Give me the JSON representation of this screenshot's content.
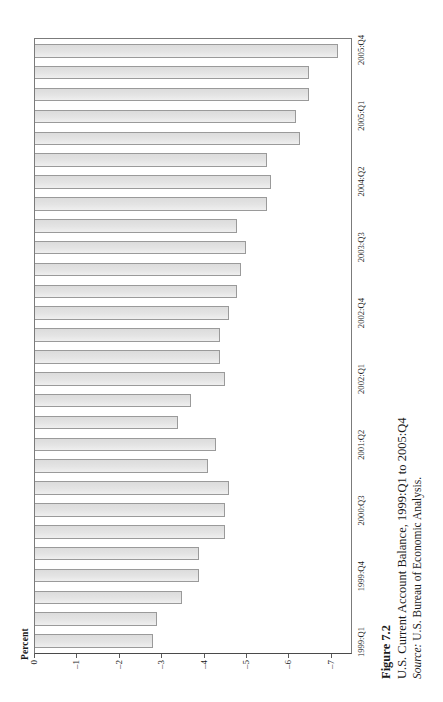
{
  "figure": {
    "number_label": "Figure 7.2",
    "title": "U.S. Current Account Balance, 1999:Q1 to 2005:Q4",
    "source_prefix": "Source:",
    "source_text": " U.S. Bureau of Economic Analysis."
  },
  "axis": {
    "value_axis_title": "Percent",
    "value_ticks": [
      "0",
      "–1",
      "–2",
      "–3",
      "–4",
      "–5",
      "–6",
      "–7"
    ],
    "category_ticks": [
      {
        "label": "1999:Q1",
        "index": 0
      },
      {
        "label": "1999:Q4",
        "index": 3
      },
      {
        "label": "2000:Q3",
        "index": 6
      },
      {
        "label": "2001:Q2",
        "index": 9
      },
      {
        "label": "2002:Q1",
        "index": 12
      },
      {
        "label": "2002:Q4",
        "index": 15
      },
      {
        "label": "2003:Q3",
        "index": 18
      },
      {
        "label": "2004:Q2",
        "index": 21
      },
      {
        "label": "2005:Q1",
        "index": 24
      },
      {
        "label": "2005:Q4",
        "index": 27
      }
    ]
  },
  "style": {
    "bar_fill": "#e4e4e4",
    "bar_border": "#9a9a9a",
    "frame_color": "#7b7b7b",
    "text_color": "#1a1a1a",
    "page_background": "#ffffff"
  },
  "chart_data": {
    "type": "bar",
    "orientation": "horizontal",
    "title": "U.S. Current Account Balance, 1999:Q1 to 2005:Q4",
    "xlabel": "",
    "ylabel": "Percent",
    "ylim": [
      0,
      -7.5
    ],
    "grid": false,
    "legend": false,
    "categories": [
      "1999:Q1",
      "1999:Q2",
      "1999:Q3",
      "1999:Q4",
      "2000:Q1",
      "2000:Q2",
      "2000:Q3",
      "2000:Q4",
      "2001:Q1",
      "2001:Q2",
      "2001:Q3",
      "2001:Q4",
      "2002:Q1",
      "2002:Q2",
      "2002:Q3",
      "2002:Q4",
      "2003:Q1",
      "2003:Q2",
      "2003:Q3",
      "2003:Q4",
      "2004:Q1",
      "2004:Q2",
      "2004:Q3",
      "2004:Q4",
      "2005:Q1",
      "2005:Q2",
      "2005:Q3",
      "2005:Q4"
    ],
    "values": [
      -2.8,
      -2.9,
      -3.5,
      -3.9,
      -3.9,
      -4.5,
      -4.5,
      -4.6,
      -4.1,
      -4.3,
      -3.4,
      -3.7,
      -4.5,
      -4.4,
      -4.4,
      -4.6,
      -4.8,
      -4.9,
      -5.0,
      -4.8,
      -5.5,
      -5.6,
      -5.5,
      -6.3,
      -6.2,
      -6.5,
      -6.5,
      -7.2
    ]
  }
}
